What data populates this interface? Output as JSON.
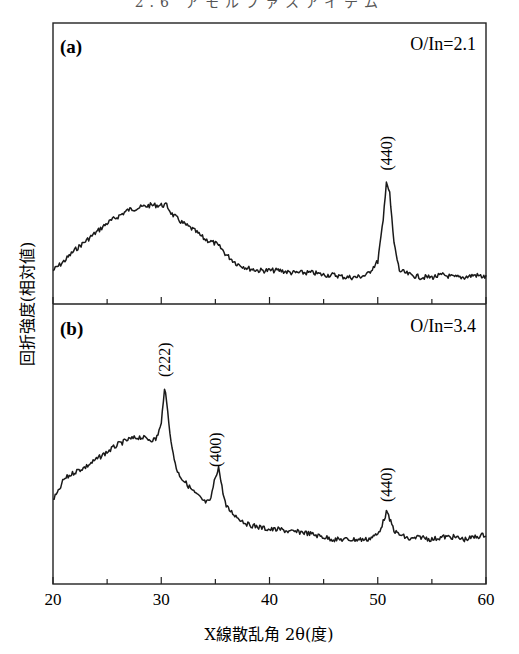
{
  "header_text": "2.6 アモルファスアイテム",
  "chart_data": {
    "type": "line",
    "title": "",
    "xlabel": "X線散乱角 2θ(度)",
    "ylabel": "回折強度(相対値)",
    "xlim": [
      20,
      60
    ],
    "xticks": [
      20,
      30,
      40,
      50,
      60
    ],
    "minor_xticks": [
      25,
      35,
      45,
      55
    ],
    "grid": false,
    "panels": [
      {
        "label": "(a)",
        "annotation": "O/In=2.1",
        "series_name": "O/In=2.1",
        "ylim": [
          0,
          1
        ],
        "x": [
          20,
          21,
          22,
          23,
          24,
          25,
          26,
          27,
          28,
          29,
          30,
          30.5,
          31,
          32,
          33,
          34,
          35,
          35.5,
          36,
          37,
          38,
          39,
          40,
          41,
          42,
          43,
          44,
          45,
          46,
          47,
          48,
          49,
          50,
          50.5,
          50.8,
          51.1,
          51.5,
          52,
          53,
          54,
          55,
          56,
          57,
          58,
          59,
          60
        ],
        "y": [
          0.06,
          0.1,
          0.15,
          0.19,
          0.23,
          0.27,
          0.3,
          0.33,
          0.34,
          0.35,
          0.35,
          0.35,
          0.31,
          0.27,
          0.24,
          0.2,
          0.18,
          0.16,
          0.13,
          0.09,
          0.07,
          0.06,
          0.06,
          0.06,
          0.05,
          0.05,
          0.05,
          0.04,
          0.04,
          0.03,
          0.03,
          0.04,
          0.1,
          0.28,
          0.46,
          0.4,
          0.18,
          0.06,
          0.04,
          0.03,
          0.03,
          0.04,
          0.03,
          0.03,
          0.04,
          0.03
        ],
        "peaks": [
          {
            "label": "(440)",
            "x": 50.8
          }
        ]
      },
      {
        "label": "(b)",
        "annotation": "O/In=3.4",
        "series_name": "O/In=3.4",
        "ylim": [
          0,
          1
        ],
        "x": [
          20,
          20.5,
          21,
          22,
          23,
          24,
          25,
          26,
          27,
          28,
          29,
          29.5,
          30,
          30.3,
          30.6,
          31,
          31.5,
          32,
          33,
          34,
          34.5,
          35,
          35.3,
          35.6,
          36,
          37,
          38,
          39,
          40,
          41,
          42,
          43,
          44,
          45,
          46,
          47,
          48,
          49,
          50,
          50.5,
          50.8,
          51.2,
          51.6,
          52,
          53,
          54,
          55,
          56,
          57,
          58,
          59,
          60
        ],
        "y": [
          0.25,
          0.28,
          0.33,
          0.36,
          0.38,
          0.41,
          0.44,
          0.47,
          0.49,
          0.5,
          0.49,
          0.49,
          0.55,
          0.7,
          0.6,
          0.45,
          0.36,
          0.33,
          0.28,
          0.24,
          0.24,
          0.34,
          0.38,
          0.3,
          0.22,
          0.18,
          0.15,
          0.14,
          0.13,
          0.13,
          0.12,
          0.12,
          0.11,
          0.1,
          0.09,
          0.09,
          0.09,
          0.09,
          0.11,
          0.16,
          0.2,
          0.16,
          0.12,
          0.11,
          0.09,
          0.1,
          0.09,
          0.1,
          0.1,
          0.09,
          0.1,
          0.11
        ],
        "peaks": [
          {
            "label": "(222)",
            "x": 30.3
          },
          {
            "label": "(400)",
            "x": 35.0
          },
          {
            "label": "(440)",
            "x": 50.8
          }
        ]
      }
    ]
  }
}
